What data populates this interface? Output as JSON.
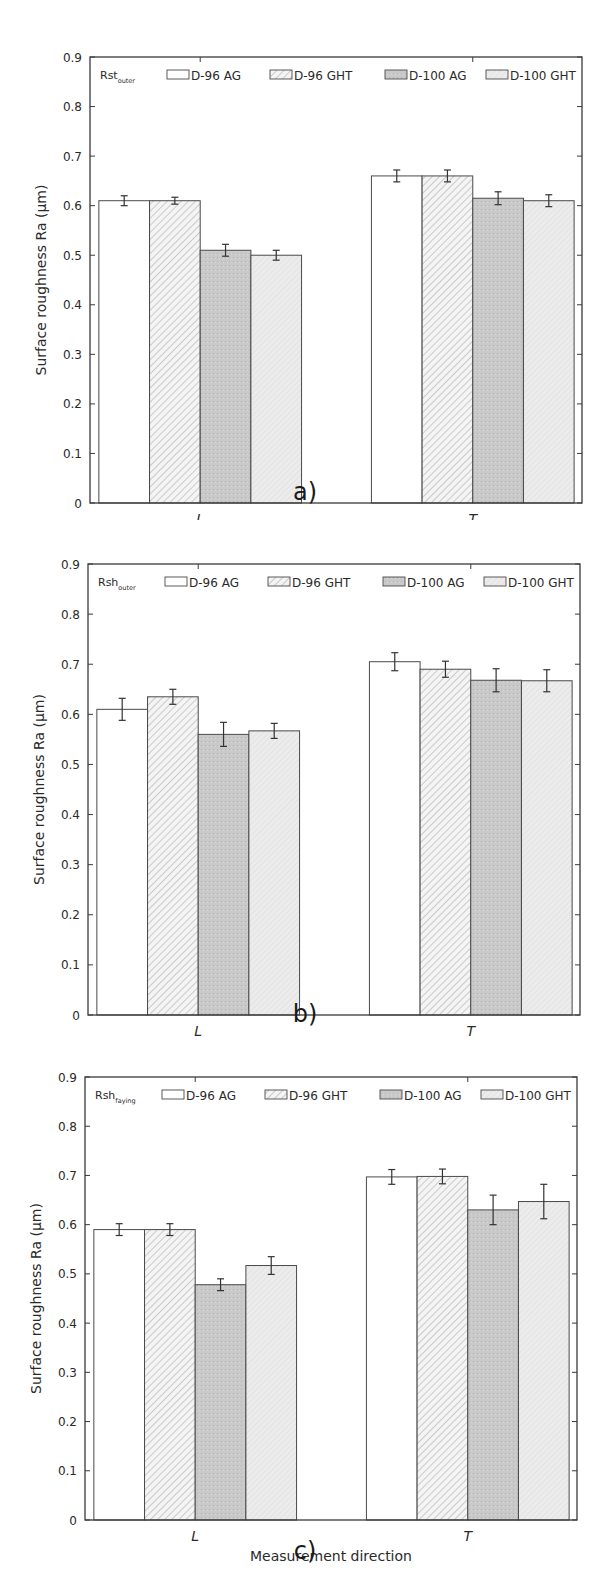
{
  "figure": {
    "panels": [
      {
        "id": "a",
        "caption": "a)",
        "label_main": "Rst",
        "label_sub": "outer"
      },
      {
        "id": "b",
        "caption": "b)",
        "label_main": "Rsh",
        "label_sub": "outer"
      },
      {
        "id": "c",
        "caption": "c)",
        "label_main": "Rsh",
        "label_sub": "faying"
      }
    ],
    "legend": [
      "D-96 AG",
      "D-96 GHT",
      "D-100 AG",
      "D-100 GHT"
    ],
    "ylabel": "Surface roughness Ra (μm)",
    "xlabel": "Measurement direction",
    "yticks": [
      "0",
      "0.1",
      "0.2",
      "0.3",
      "0.4",
      "0.5",
      "0.6",
      "0.7",
      "0.8",
      "0.9"
    ],
    "categories": [
      "L",
      "T"
    ],
    "colors": {
      "d96ag": "#ffffff",
      "d96ght_hatch": "#b8b8b8",
      "d100ag": "#c9c9c9",
      "d100ght": "#ececec",
      "axis": "#3a3a3a",
      "bar_edge": "#4a4a4a"
    }
  },
  "chart_data": [
    {
      "type": "bar",
      "title": "Rst_outer",
      "caption": "a)",
      "categories": [
        "L",
        "T"
      ],
      "xlabel": "Measurement direction",
      "ylabel": "Surface roughness Ra (μm)",
      "ylim": [
        0,
        0.9
      ],
      "yticks": [
        0,
        0.1,
        0.2,
        0.3,
        0.4,
        0.5,
        0.6,
        0.7,
        0.8,
        0.9
      ],
      "grid": false,
      "legend_position": "top inside",
      "series": [
        {
          "name": "D-96 AG",
          "values": [
            0.61,
            0.66
          ],
          "errors": [
            0.01,
            0.012
          ]
        },
        {
          "name": "D-96 GHT",
          "values": [
            0.61,
            0.66
          ],
          "errors": [
            0.007,
            0.012
          ]
        },
        {
          "name": "D-100 AG",
          "values": [
            0.51,
            0.615
          ],
          "errors": [
            0.012,
            0.013
          ]
        },
        {
          "name": "D-100 GHT",
          "values": [
            0.5,
            0.61
          ],
          "errors": [
            0.01,
            0.012
          ]
        }
      ]
    },
    {
      "type": "bar",
      "title": "Rsh_outer",
      "caption": "b)",
      "categories": [
        "L",
        "T"
      ],
      "xlabel": "Measurement direction",
      "ylabel": "Surface roughness Ra (μm)",
      "ylim": [
        0,
        0.9
      ],
      "yticks": [
        0,
        0.1,
        0.2,
        0.3,
        0.4,
        0.5,
        0.6,
        0.7,
        0.8,
        0.9
      ],
      "grid": false,
      "legend_position": "top inside",
      "series": [
        {
          "name": "D-96 AG",
          "values": [
            0.61,
            0.705
          ],
          "errors": [
            0.022,
            0.018
          ]
        },
        {
          "name": "D-96 GHT",
          "values": [
            0.635,
            0.69
          ],
          "errors": [
            0.015,
            0.016
          ]
        },
        {
          "name": "D-100 AG",
          "values": [
            0.56,
            0.668
          ],
          "errors": [
            0.024,
            0.023
          ]
        },
        {
          "name": "D-100 GHT",
          "values": [
            0.567,
            0.667
          ],
          "errors": [
            0.015,
            0.022
          ]
        }
      ]
    },
    {
      "type": "bar",
      "title": "Rsh_faying",
      "caption": "c)",
      "categories": [
        "L",
        "T"
      ],
      "xlabel": "Measurement direction",
      "ylabel": "Surface roughness Ra (μm)",
      "ylim": [
        0,
        0.9
      ],
      "yticks": [
        0,
        0.1,
        0.2,
        0.3,
        0.4,
        0.5,
        0.6,
        0.7,
        0.8,
        0.9
      ],
      "grid": false,
      "legend_position": "top inside",
      "series": [
        {
          "name": "D-96 AG",
          "values": [
            0.59,
            0.697
          ],
          "errors": [
            0.012,
            0.015
          ]
        },
        {
          "name": "D-96 GHT",
          "values": [
            0.59,
            0.698
          ],
          "errors": [
            0.012,
            0.015
          ]
        },
        {
          "name": "D-100 AG",
          "values": [
            0.478,
            0.63
          ],
          "errors": [
            0.012,
            0.03
          ]
        },
        {
          "name": "D-100 GHT",
          "values": [
            0.517,
            0.647
          ],
          "errors": [
            0.018,
            0.035
          ]
        }
      ]
    }
  ]
}
